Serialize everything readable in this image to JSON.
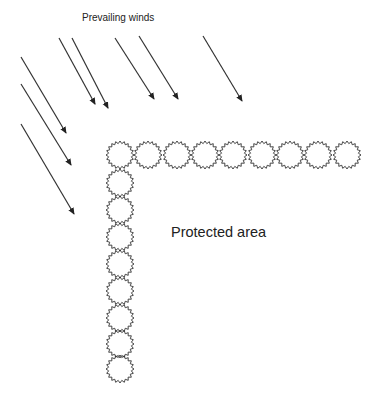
{
  "labels": {
    "winds": "Prevailing winds",
    "protected_area": "Protected area"
  },
  "colors": {
    "stroke": "#333333",
    "text": "#222222",
    "background": "#ffffff"
  },
  "wind_arrows": [
    {
      "x1": 59,
      "y1": 38,
      "x2": 95,
      "y2": 104
    },
    {
      "x1": 72,
      "y1": 38,
      "x2": 108,
      "y2": 108
    },
    {
      "x1": 115,
      "y1": 38,
      "x2": 154,
      "y2": 99
    },
    {
      "x1": 139,
      "y1": 36,
      "x2": 178,
      "y2": 99
    },
    {
      "x1": 203,
      "y1": 36,
      "x2": 242,
      "y2": 101
    },
    {
      "x1": 21,
      "y1": 57,
      "x2": 66,
      "y2": 133
    },
    {
      "x1": 21,
      "y1": 84,
      "x2": 71,
      "y2": 165
    },
    {
      "x1": 21,
      "y1": 124,
      "x2": 74,
      "y2": 214
    }
  ],
  "windbreak": {
    "shape": "serrated-circle",
    "points": 20,
    "outer_radius": 14,
    "inner_radius": 11.5,
    "horizontal_row": {
      "y": 155,
      "centers_x": [
        120,
        148,
        177,
        205,
        233,
        262,
        290,
        318,
        347
      ]
    },
    "vertical_column": {
      "x": 120,
      "centers_y": [
        183,
        210,
        237,
        264,
        291,
        318,
        344,
        369
      ]
    }
  }
}
